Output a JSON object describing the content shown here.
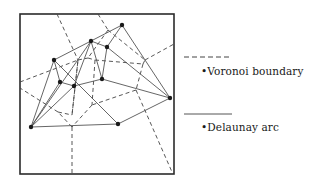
{
  "diagram": {
    "frame": {
      "x": 20,
      "y": 14,
      "width": 154,
      "height": 160
    },
    "colors": {
      "stroke": "#2b2b2b",
      "voronoi": "#444444",
      "delaunay": "#555555",
      "point": "#1a1a1a"
    },
    "points": [
      {
        "id": "p1",
        "x": 122,
        "y": 25
      },
      {
        "id": "p2",
        "x": 91,
        "y": 41
      },
      {
        "id": "p3",
        "x": 107,
        "y": 47
      },
      {
        "id": "p4",
        "x": 54,
        "y": 60
      },
      {
        "id": "p5",
        "x": 60,
        "y": 82
      },
      {
        "id": "p6",
        "x": 74,
        "y": 86
      },
      {
        "id": "p7",
        "x": 102,
        "y": 79
      },
      {
        "id": "p8",
        "x": 170,
        "y": 98
      },
      {
        "id": "p9",
        "x": 31,
        "y": 127
      },
      {
        "id": "p10",
        "x": 118,
        "y": 124
      }
    ],
    "delaunay_arcs": [
      [
        "p1",
        "p2"
      ],
      [
        "p1",
        "p3"
      ],
      [
        "p1",
        "p8"
      ],
      [
        "p2",
        "p4"
      ],
      [
        "p2",
        "p3"
      ],
      [
        "p2",
        "p6"
      ],
      [
        "p2",
        "p7"
      ],
      [
        "p3",
        "p7"
      ],
      [
        "p3",
        "p8"
      ],
      [
        "p4",
        "p9"
      ],
      [
        "p4",
        "p5"
      ],
      [
        "p4",
        "p10"
      ],
      [
        "p5",
        "p6"
      ],
      [
        "p5",
        "p9"
      ],
      [
        "p6",
        "p7"
      ],
      [
        "p6",
        "p9"
      ],
      [
        "p7",
        "p8"
      ],
      [
        "p8",
        "p10"
      ],
      [
        "p9",
        "p10"
      ],
      [
        "p9",
        "p2"
      ]
    ],
    "voronoi_boundaries": [
      [
        [
          57,
          14
        ],
        [
          78,
          60
        ]
      ],
      [
        [
          78,
          60
        ],
        [
          72,
          115
        ]
      ],
      [
        [
          98,
          14
        ],
        [
          108,
          30
        ]
      ],
      [
        [
          108,
          30
        ],
        [
          88,
          58
        ]
      ],
      [
        [
          20,
          82
        ],
        [
          78,
          60
        ]
      ],
      [
        [
          78,
          60
        ],
        [
          88,
          58
        ]
      ],
      [
        [
          88,
          58
        ],
        [
          95,
          60
        ]
      ],
      [
        [
          95,
          60
        ],
        [
          143,
          64
        ]
      ],
      [
        [
          108,
          30
        ],
        [
          145,
          60
        ]
      ],
      [
        [
          145,
          60
        ],
        [
          174,
          44
        ]
      ],
      [
        [
          143,
          64
        ],
        [
          145,
          60
        ]
      ],
      [
        [
          143,
          64
        ],
        [
          136,
          90
        ]
      ],
      [
        [
          136,
          90
        ],
        [
          92,
          105
        ]
      ],
      [
        [
          136,
          90
        ],
        [
          172,
          172
        ]
      ],
      [
        [
          95,
          60
        ],
        [
          92,
          105
        ]
      ],
      [
        [
          92,
          105
        ],
        [
          72,
          127
        ]
      ],
      [
        [
          72,
          127
        ],
        [
          72,
          174
        ]
      ],
      [
        [
          72,
          127
        ],
        [
          58,
          112
        ]
      ],
      [
        [
          58,
          112
        ],
        [
          20,
          88
        ]
      ],
      [
        [
          58,
          112
        ],
        [
          72,
          115
        ]
      ],
      [
        [
          72,
          115
        ],
        [
          78,
          60
        ]
      ]
    ]
  },
  "legend": {
    "voronoi": {
      "label": "Voronoi boundary",
      "marker": "•"
    },
    "delaunay": {
      "label": "Delaunay arc",
      "marker": "•"
    }
  }
}
